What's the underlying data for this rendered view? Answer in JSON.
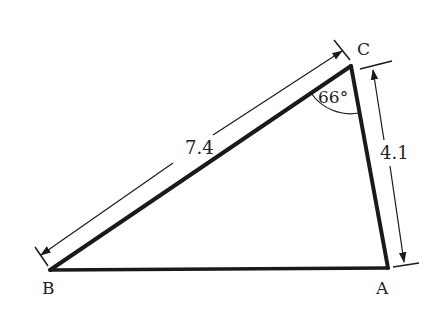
{
  "figure": {
    "type": "triangle",
    "vertices": {
      "A": {
        "label": "A",
        "x": 388,
        "y": 268
      },
      "B": {
        "label": "B",
        "x": 50,
        "y": 270
      },
      "C": {
        "label": "C",
        "x": 350,
        "y": 66
      }
    },
    "sides": {
      "BC": {
        "label": "7.4"
      },
      "CA": {
        "label": "4.1"
      }
    },
    "angles": {
      "C": {
        "label": "66°"
      }
    },
    "colors": {
      "stroke": "#1a1a1a",
      "text": "#222222",
      "background": "#ffffff"
    }
  }
}
